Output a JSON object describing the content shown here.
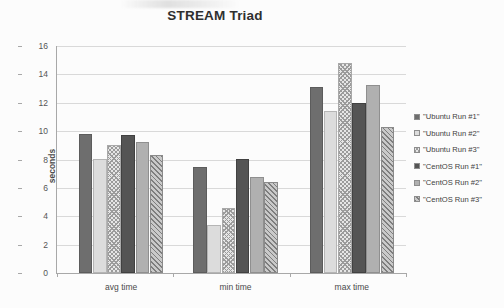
{
  "chart_data": {
    "type": "bar",
    "title": "STREAM Triad",
    "xlabel": "",
    "ylabel": "seconds",
    "ylim": [
      0,
      16
    ],
    "ytick_step": 2,
    "yticks": [
      "16",
      "14",
      "12",
      "10",
      "8",
      "6",
      "4",
      "2",
      "0"
    ],
    "grid": true,
    "legend_position": "right",
    "categories": [
      "avg time",
      "min time",
      "max time"
    ],
    "series": [
      {
        "name": "\"Ubuntu Run #1\"",
        "values": [
          9.8,
          7.45,
          13.1
        ],
        "swatch": "dark-gray-solid",
        "color": "#6e6e6e"
      },
      {
        "name": "\"Ubuntu Run #2\"",
        "values": [
          8.05,
          3.35,
          11.4
        ],
        "swatch": "light-gray-solid",
        "color": "#dcdcdc"
      },
      {
        "name": "\"Ubuntu Run #3\"",
        "values": [
          9.05,
          4.55,
          14.8
        ],
        "swatch": "light-crosshatch",
        "color": "#e6e6e6"
      },
      {
        "name": "\"CentOS Run #1\"",
        "values": [
          9.7,
          8.05,
          11.95
        ],
        "swatch": "darkest-gray-solid",
        "color": "#545454"
      },
      {
        "name": "\"CentOS Run #2\"",
        "values": [
          9.2,
          6.8,
          13.25
        ],
        "swatch": "medium-gray-solid",
        "color": "#b0b0b0"
      },
      {
        "name": "\"CentOS Run #3\"",
        "values": [
          8.35,
          6.45,
          10.3
        ],
        "swatch": "diagonal-hatch",
        "color": "#c9c9c9"
      }
    ]
  }
}
